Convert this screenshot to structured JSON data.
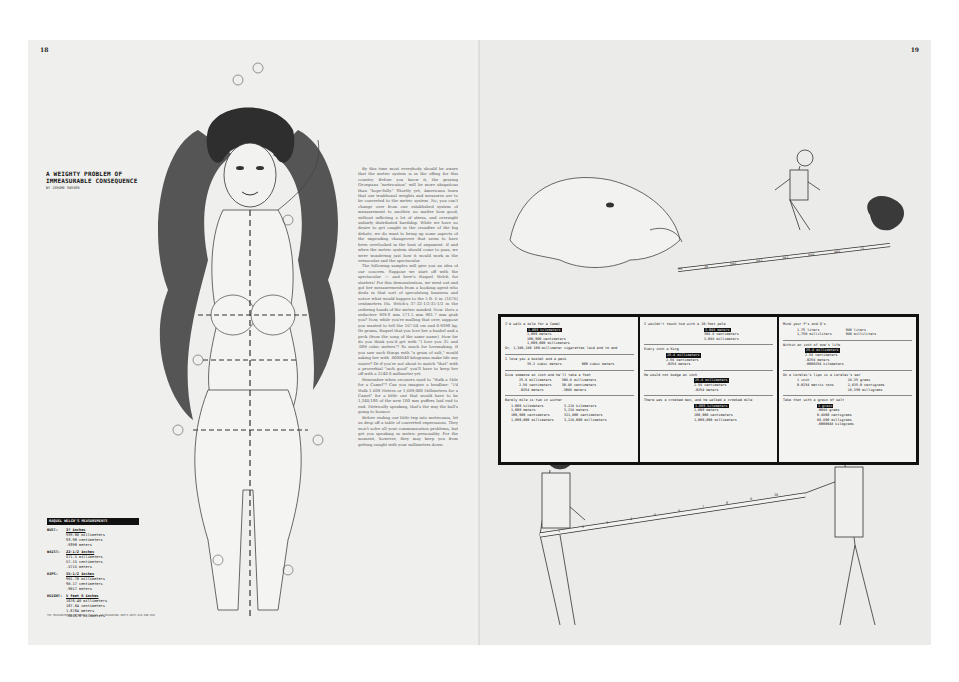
{
  "spread": {
    "left_page": {
      "folio": "18",
      "title_line1": "A WEIGHTY PROBLEM OF",
      "title_line2": "IMMEASURABLE CONSEQUENCE",
      "byline": "BY JEROME SNYDER",
      "measurements": {
        "heading": "RAQUEL WELCH'S MEASUREMENTS",
        "rows": [
          {
            "label": "BUST:",
            "values": [
              "37 inches",
              "939.80 millimeters",
              "93.98 centimeters",
              ".9398 meters"
            ]
          },
          {
            "label": "WAIST:",
            "values": [
              "22-1/2 inches",
              "571.5 millimeters",
              "57.15 centimeters",
              ".5715 meters"
            ]
          },
          {
            "label": "HIPS:",
            "values": [
              "35-1/2 inches",
              "901.70 millimeters",
              "90.17 centimeters",
              ".9017 meters"
            ]
          },
          {
            "label": "HEIGHT:",
            "values": [
              "5 feet 6 inches",
              "1676.40 millimeters",
              "167.64 centimeters",
              "1.6764 meters",
              ".001676 kilometers"
            ]
          }
        ]
      },
      "caption": "THE MEASUREMENTS OF RAQUEL WELCH, IN MEASURING UNITS BOTH OLD AND NEW",
      "body_paragraphs": [
        "By this time most everybody should be aware that the metric system is in the offing for this country. Before you know it, the graying Georgians \"metrication\" will be more ubiquitous than \"hope-fully.\" Shortly yet, Americans learn that our traditional weights and measures are to be converted to the metric system. No, you can't change over from one established system of measurement to another, no matter how good, without inflicting a lot of stress, and overnight unfairly distributed hardship. While we have no desire to get caught in the crossfire of the big debate, we do want to bring up some aspects of the impending changeover that seem to have been overlooked in the heat of argument. If and when the metric system should come to pass, we were wondering just how it would work in the vernacular and the spectacular.",
        "The following samples will give you an idea of our concern. Suppose we start off with the spectacular — and here's Raquel Welch for starters! For this demonstration, we went out and got her measurements from a booking agent who deals in that sort of speculating business and notice what would happen to the 5 ft. 6 in. (1676) centimeters Ms. Welch's 37-22-1/2-35-1/2 in the ordering hands of the metric minded. Now. Does a seductive 939.8 mm 571.5 mm 901.7 mm grab you? Now, while you're mulling that over, suppose you wanted to tell the 167.64 cm and 0.9398 kg. Or grams, Raquel that you love her a bushel and a peck (from the song of the same name). How far do you think you'd get with \"I love you 35 and .009 cubic meters\"? So much for lovemaking. If you saw such things with \"a grain of salt,\" would asking her with .0000648 kilograms make life any easier? Or if you're not about to match \"that\" with a proverbial \"inch good\" you'll have to keep her off with a 2540 0 millimeter yet.",
        "Remember when crooners used to \"Walk a Mile for a Camel\"? Can you imagine a headline: \"I'd Walk 1.609 Meters or 1,609,000 Millimeters for a Camel\" for a little one that would have to be 1,340,180 of the new 100 mm puffers laid end to end. Metrically speaking, that's the way the ball's going to bounce.",
        "Before ending our little trip into metricania, let us drop off a table of converted expressions. They won't solve all your communication problems, but get you speaking in metric personality. For the moment, however, they may keep you from getting caught with your millimeters down."
      ]
    },
    "right_page": {
      "folio": "19",
      "tape_top_labels": [
        "39",
        "38",
        "506",
        "602",
        "302",
        "699",
        "405",
        "73"
      ],
      "tape_bottom_labels": [
        "1",
        "2",
        "3",
        "4",
        "5",
        "6",
        "7",
        "8",
        "9",
        "10"
      ],
      "table": {
        "columns": [
          [
            {
              "prompt": "I'd walk a mile for a Camel",
              "values": [
                "1.609 kilometers",
                "1,609 meters",
                "160,900 centimeters",
                "1,609,000 millimeters"
              ],
              "note": "Or, 1,340,180 100-millimeter cigarettes laid end to end"
            },
            {
              "prompt": "I love you a bushel  and a peck",
              "values": [
                "35.2 cubic meters",
                "009 cubic meters"
              ]
            },
            {
              "prompt": "Give someone an inch and he'll take a foot",
              "values": [
                "25.4 millimeters",
                "2.54 centimeters",
                ".0254 meters"
              ],
              "values2": [
                "304.8 millimeters",
                "30.48 centimeters",
                ".3048 meters"
              ]
            },
            {
              "prompt": "Barely mile  is two in winter",
              "values": [
                "1.609 kilometers",
                "1,609 meters",
                "160,900 centimeters",
                "1,609,000 millimeters"
              ],
              "values2": [
                "3.218 kilometers",
                "3,218 meters",
                "321,800 centimeters",
                "3,218,000 millimeters"
              ]
            }
          ],
          [
            {
              "prompt": "I wouldn't touch him with a 10-foot pole",
              "values": [
                "3.048 meters",
                "304.8 centimeters",
                "3,048 millimeters"
              ]
            },
            {
              "prompt": "Every inch a King",
              "values": [
                "25.4 millimeters",
                "2.54 centimeters",
                ".0254 meters"
              ]
            },
            {
              "prompt": "He would not budge an inch",
              "values": [
                "25.4 millimeters",
                "2.54 centimeters",
                ".0254 meters"
              ]
            },
            {
              "prompt": "There was a crooked man, and he walked a crooked mile",
              "values": [
                "1.609 kilometers",
                "1,609 meters",
                "160,900 centimeters",
                "1,609,000 millimeters"
              ]
            }
          ],
          [
            {
              "prompt": "Mind your P's  and Q's",
              "values": [
                "1.75 liters",
                "1,750 milliliters"
              ],
              "values2": [
                "946 liters",
                "946 milliliters"
              ]
            },
            {
              "prompt": "Within an inch of one's life",
              "values": [
                "25.4 millimeters",
                "2.54 centimeters",
                ".0254 meters",
                ".0000254 kilometers"
              ]
            },
            {
              "prompt": "On a Lorelei's lips is a Lorelei's ear",
              "values": [
                "1 inch",
                "0.0254 metric tons"
              ],
              "values2": [
                "28.35 grams",
                "2,835.0 centigrams",
                "28,350 milligrams"
              ]
            },
            {
              "prompt": "Take that with a grain of salt",
              "values": [
                "1 grain",
                ".0648 grams",
                "6.4800 centigrams",
                "64.800 milligrams",
                ".0000648 kilograms"
              ]
            }
          ]
        ]
      }
    }
  }
}
